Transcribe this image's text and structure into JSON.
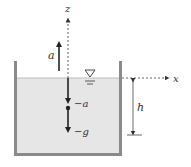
{
  "diagram": {
    "labels": {
      "z_axis": "z",
      "x_axis": "x",
      "accel_up": "a",
      "neg_a": "−a",
      "neg_g": "−g",
      "height": "h"
    },
    "colors": {
      "liquid": "#e6e6e6",
      "wall": "#888888",
      "line": "#222222",
      "axis": "#555555",
      "background": "#ffffff"
    },
    "symbols": {
      "free_surface": "free-surface-triangle"
    }
  }
}
